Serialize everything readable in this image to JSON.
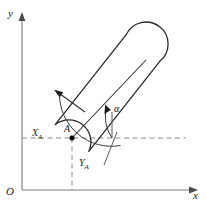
{
  "figure": {
    "kind": "technical-line-diagram",
    "background_color": "#ffffff",
    "line_color": "#2b2b2b",
    "axis_color": "#7d7d7d",
    "dashed_color": "#8a8a8a",
    "axes": {
      "y_label": "y",
      "x_label": "x",
      "origin_label": "O"
    },
    "labels": {
      "point": "A",
      "x_coordinate": "X",
      "x_coordinate_sub": "A",
      "y_coordinate": "Y",
      "y_coordinate_sub": "A",
      "angle": "α"
    }
  }
}
